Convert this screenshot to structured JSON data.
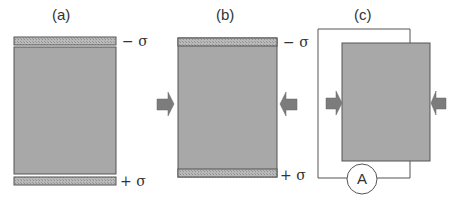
{
  "panels": {
    "a": {
      "label": "(a)",
      "top_charge": "− σ",
      "bottom_charge": "+ σ"
    },
    "b": {
      "label": "(b)",
      "top_charge": "− σ",
      "bottom_charge": "+ σ"
    },
    "c": {
      "label": "(c)",
      "meter_label": "A"
    }
  },
  "colors": {
    "block_fill": "#a8a8a8",
    "electrode_fill": "#b4b4b4",
    "arrow_fill": "#7c7c7c",
    "line": "#555555"
  },
  "icons": {
    "force_arrow": "right-pointing-arrow",
    "ammeter": "circle-with-A"
  }
}
